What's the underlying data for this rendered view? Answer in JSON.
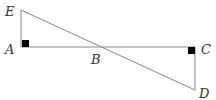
{
  "diagram": {
    "type": "geometry",
    "points": {
      "E": {
        "label": "E",
        "x": 21,
        "y": 10
      },
      "A": {
        "label": "A",
        "x": 21,
        "y": 47
      },
      "B": {
        "label": "B",
        "x": 101,
        "y": 47
      },
      "C": {
        "label": "C",
        "x": 195,
        "y": 47
      },
      "D": {
        "label": "D",
        "x": 195,
        "y": 90
      }
    },
    "segments": [
      "EA",
      "AC",
      "CD",
      "ED"
    ],
    "right_angles": [
      "A",
      "C"
    ],
    "colors": {
      "line": "#888888",
      "marker": "#000000",
      "label": "#333333"
    }
  }
}
